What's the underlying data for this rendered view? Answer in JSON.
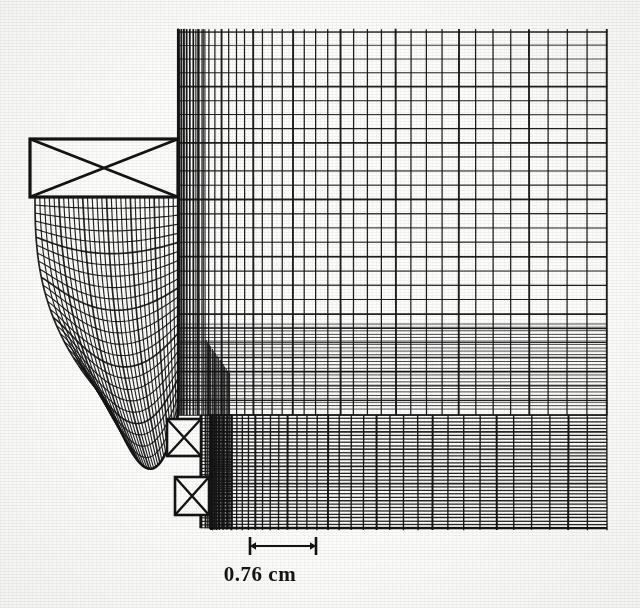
{
  "figure": {
    "background_color": "#fdfdfc",
    "ink_color": "#141414",
    "annotations": {
      "dimension_label": "0.76 cm"
    },
    "dimension": {
      "value": 0.76,
      "unit": "cm",
      "label": "0.76 cm",
      "x_start": 250,
      "x_end": 316,
      "y": 546,
      "tick_half_height": 9,
      "arrow_size": 6
    },
    "coils": [
      {
        "name": "main-coil",
        "x": 30,
        "y": 139,
        "w": 148,
        "h": 58,
        "cross": true,
        "stroke": 3.2
      },
      {
        "name": "lower-coil-upper",
        "x": 167,
        "y": 419,
        "w": 34,
        "h": 37,
        "cross": true,
        "stroke": 2.6
      },
      {
        "name": "lower-coil-lower",
        "x": 175,
        "y": 477,
        "w": 34,
        "h": 38,
        "cross": true,
        "stroke": 2.6
      }
    ],
    "regions": {
      "upper_right_mesh": {
        "name": "air-gap-outer-mesh",
        "x0": 178,
        "x1": 607,
        "y0": 32,
        "y1": 415,
        "n_cols": 40,
        "n_rows": 27,
        "x_grading": 1.9,
        "y_grading": 1.0
      },
      "lower_right_mesh": {
        "name": "armature-lower-mesh",
        "x0": 211,
        "x1": 607,
        "y0": 415,
        "y1": 528,
        "n_cols": 38,
        "n_rows": 30,
        "x_grading": 1.9,
        "y_grading": 0.95
      },
      "curved_mesh": {
        "name": "pole-piece-curved-mesh",
        "x_left_top": 35,
        "x_right": 178,
        "y_top": 197,
        "y_bottom": 415,
        "n_cols": 30,
        "n_rows": 24,
        "curve_depth": 62
      },
      "plunger_strip": {
        "name": "plunger-strip-mesh",
        "x0": 201,
        "x1": 232,
        "y0": 415,
        "y1": 528,
        "n_cols": 7,
        "n_rows": 34
      }
    },
    "chart_data": {
      "type": "diagram",
      "subtype": "finite-element-mesh",
      "title": "Finite element mesh",
      "annotations": [
        {
          "text": "0.76 cm",
          "kind": "dimension",
          "x": 283,
          "y": 580
        }
      ],
      "legend": [],
      "axis": {
        "visible": false
      },
      "grid": true,
      "elements": {
        "coil_symbols": 3,
        "mesh_blocks": 4
      }
    }
  }
}
